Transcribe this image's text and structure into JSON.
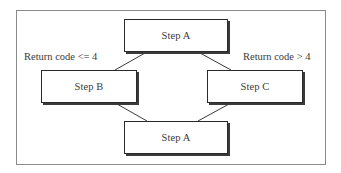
{
  "diagram": {
    "nodes": [
      {
        "id": "step-a-top",
        "label": "Step A"
      },
      {
        "id": "step-b",
        "label": "Step B"
      },
      {
        "id": "step-c",
        "label": "Step C"
      },
      {
        "id": "step-a-bottom",
        "label": "Step A"
      }
    ],
    "edges": [
      {
        "from": "step-a-top",
        "to": "step-b",
        "label": "Return code <= 4"
      },
      {
        "from": "step-a-top",
        "to": "step-c",
        "label": "Return code > 4"
      },
      {
        "from": "step-b",
        "to": "step-a-bottom"
      },
      {
        "from": "step-c",
        "to": "step-a-bottom"
      }
    ],
    "labels": {
      "left_condition": "Return code <= 4",
      "right_condition": "Return code > 4"
    },
    "colors": {
      "frame": "#8a8a8a",
      "box_border": "#2a2a2a",
      "shadow": "#3a3a3a",
      "text": "#3a3a3a"
    }
  }
}
